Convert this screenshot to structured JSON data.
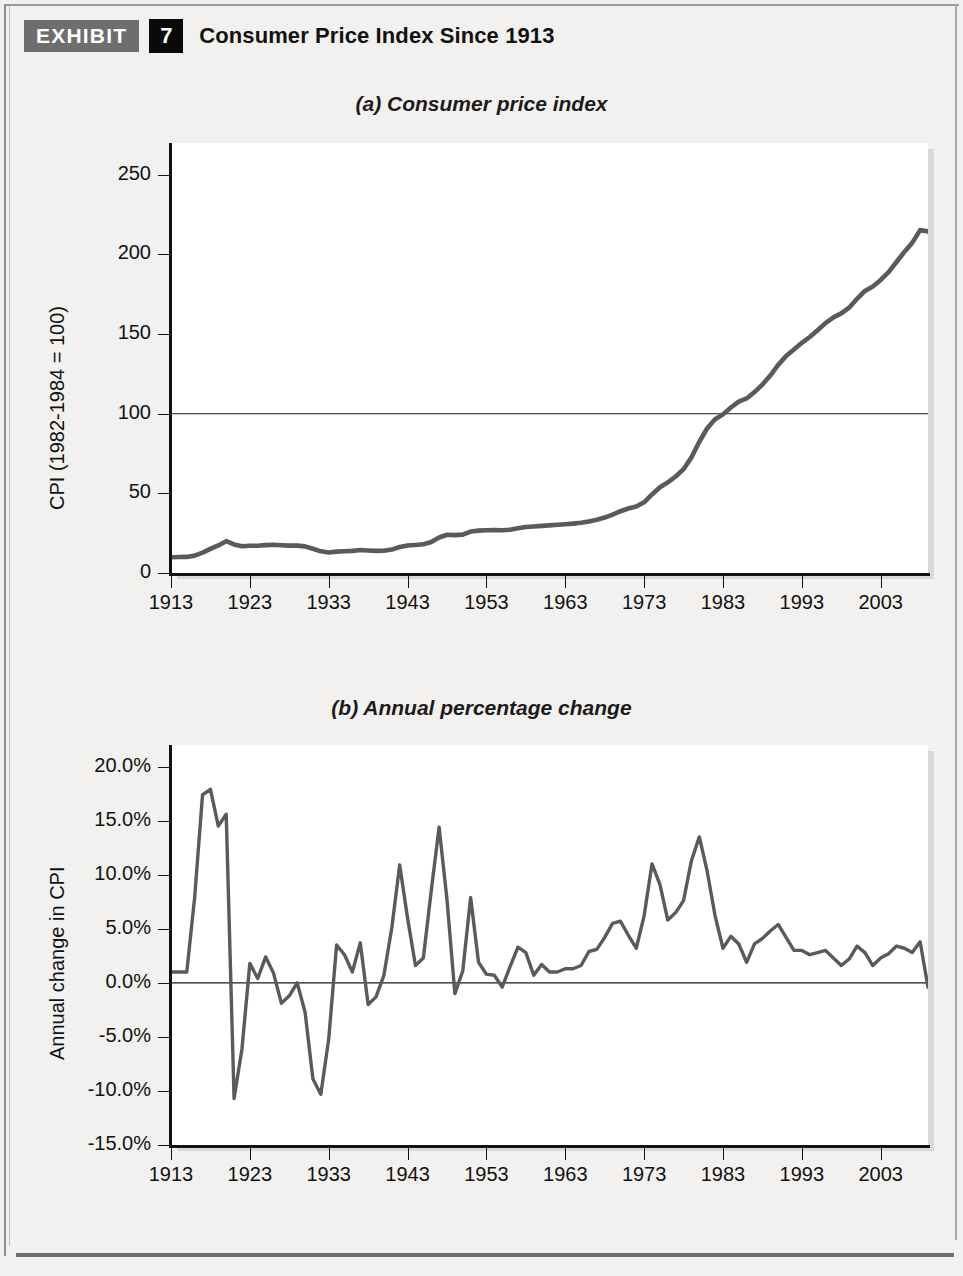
{
  "header": {
    "exhibit_label": "EXHIBIT",
    "exhibit_number": "7",
    "title": "Consumer Price Index Since 1913"
  },
  "chart_data": [
    {
      "type": "line",
      "panel": "a",
      "title": "(a) Consumer price index",
      "xlabel": "",
      "ylabel": "CPI (1982-1984 = 100)",
      "xlim": [
        1913,
        2009
      ],
      "ylim": [
        0,
        270
      ],
      "yticks": [
        0,
        50,
        100,
        150,
        200,
        250
      ],
      "ytick_labels": [
        "0",
        "50",
        "100",
        "150",
        "200",
        "250"
      ],
      "xticks": [
        1913,
        1923,
        1933,
        1943,
        1953,
        1963,
        1973,
        1983,
        1993,
        2003
      ],
      "xtick_labels": [
        "1913",
        "1923",
        "1933",
        "1943",
        "1953",
        "1963",
        "1973",
        "1983",
        "1993",
        "2003"
      ],
      "grid": false,
      "reference_line": 100,
      "legend": null,
      "line_color": "#5a5a5a",
      "x": [
        1913,
        1914,
        1915,
        1916,
        1917,
        1918,
        1919,
        1920,
        1921,
        1922,
        1923,
        1924,
        1925,
        1926,
        1927,
        1928,
        1929,
        1930,
        1931,
        1932,
        1933,
        1934,
        1935,
        1936,
        1937,
        1938,
        1939,
        1940,
        1941,
        1942,
        1943,
        1944,
        1945,
        1946,
        1947,
        1948,
        1949,
        1950,
        1951,
        1952,
        1953,
        1954,
        1955,
        1956,
        1957,
        1958,
        1959,
        1960,
        1961,
        1962,
        1963,
        1964,
        1965,
        1966,
        1967,
        1968,
        1969,
        1970,
        1971,
        1972,
        1973,
        1974,
        1975,
        1976,
        1977,
        1978,
        1979,
        1980,
        1981,
        1982,
        1983,
        1984,
        1985,
        1986,
        1987,
        1988,
        1989,
        1990,
        1991,
        1992,
        1993,
        1994,
        1995,
        1996,
        1997,
        1998,
        1999,
        2000,
        2001,
        2002,
        2003,
        2004,
        2005,
        2006,
        2007,
        2008,
        2009
      ],
      "values": [
        9.9,
        10.0,
        10.1,
        10.9,
        12.8,
        15.1,
        17.3,
        20.0,
        17.9,
        16.8,
        17.1,
        17.1,
        17.5,
        17.7,
        17.4,
        17.2,
        17.2,
        16.7,
        15.2,
        13.6,
        12.9,
        13.4,
        13.7,
        13.9,
        14.4,
        14.1,
        13.9,
        14.0,
        14.7,
        16.3,
        17.3,
        17.6,
        18.0,
        19.5,
        22.3,
        24.0,
        23.8,
        24.1,
        26.0,
        26.6,
        26.8,
        26.9,
        26.8,
        27.2,
        28.1,
        28.9,
        29.2,
        29.6,
        29.9,
        30.3,
        30.6,
        31.0,
        31.5,
        32.4,
        33.4,
        34.8,
        36.7,
        38.8,
        40.5,
        41.8,
        44.4,
        49.3,
        53.8,
        56.9,
        60.6,
        65.2,
        72.6,
        82.4,
        90.9,
        96.5,
        99.6,
        103.9,
        107.6,
        109.6,
        113.6,
        118.3,
        124.0,
        130.7,
        136.2,
        140.3,
        144.5,
        148.2,
        152.4,
        156.9,
        160.5,
        163.0,
        166.6,
        172.2,
        177.1,
        179.9,
        184.0,
        188.9,
        195.3,
        201.6,
        207.3,
        215.3,
        214.5
      ]
    },
    {
      "type": "line",
      "panel": "b",
      "title": "(b) Annual percentage change",
      "xlabel": "",
      "ylabel": "Annual change in CPI",
      "xlim": [
        1913,
        2009
      ],
      "ylim": [
        -15.0,
        22.0
      ],
      "yticks": [
        -15.0,
        -10.0,
        -5.0,
        0.0,
        5.0,
        10.0,
        15.0,
        20.0
      ],
      "ytick_labels": [
        "-15.0%",
        "-10.0%",
        "-5.0%",
        "0.0%",
        "5.0%",
        "10.0%",
        "15.0%",
        "20.0%"
      ],
      "xticks": [
        1913,
        1923,
        1933,
        1943,
        1953,
        1963,
        1973,
        1983,
        1993,
        2003
      ],
      "xtick_labels": [
        "1913",
        "1923",
        "1933",
        "1943",
        "1953",
        "1963",
        "1973",
        "1983",
        "1993",
        "2003"
      ],
      "grid": false,
      "reference_line": 0,
      "legend": null,
      "line_color": "#5a5a5a",
      "x": [
        1913,
        1914,
        1915,
        1916,
        1917,
        1918,
        1919,
        1920,
        1921,
        1922,
        1923,
        1924,
        1925,
        1926,
        1927,
        1928,
        1929,
        1930,
        1931,
        1932,
        1933,
        1934,
        1935,
        1936,
        1937,
        1938,
        1939,
        1940,
        1941,
        1942,
        1943,
        1944,
        1945,
        1946,
        1947,
        1948,
        1949,
        1950,
        1951,
        1952,
        1953,
        1954,
        1955,
        1956,
        1957,
        1958,
        1959,
        1960,
        1961,
        1962,
        1963,
        1964,
        1965,
        1966,
        1967,
        1968,
        1969,
        1970,
        1971,
        1972,
        1973,
        1974,
        1975,
        1976,
        1977,
        1978,
        1979,
        1980,
        1981,
        1982,
        1983,
        1984,
        1985,
        1986,
        1987,
        1988,
        1989,
        1990,
        1991,
        1992,
        1993,
        1994,
        1995,
        1996,
        1997,
        1998,
        1999,
        2000,
        2001,
        2002,
        2003,
        2004,
        2005,
        2006,
        2007,
        2008,
        2009
      ],
      "values": [
        1.0,
        1.0,
        1.0,
        7.9,
        17.4,
        17.9,
        14.5,
        15.6,
        -10.7,
        -6.1,
        1.8,
        0.4,
        2.4,
        0.9,
        -1.9,
        -1.2,
        0.0,
        -2.7,
        -8.9,
        -10.3,
        -5.2,
        3.5,
        2.6,
        1.0,
        3.7,
        -2.0,
        -1.3,
        0.7,
        5.1,
        10.9,
        6.0,
        1.6,
        2.3,
        8.5,
        14.4,
        7.7,
        -1.0,
        1.1,
        7.9,
        1.9,
        0.8,
        0.7,
        -0.4,
        1.5,
        3.3,
        2.8,
        0.7,
        1.7,
        1.0,
        1.0,
        1.3,
        1.3,
        1.6,
        2.9,
        3.1,
        4.2,
        5.5,
        5.7,
        4.4,
        3.2,
        6.2,
        11.0,
        9.1,
        5.8,
        6.5,
        7.6,
        11.3,
        13.5,
        10.3,
        6.2,
        3.2,
        4.3,
        3.6,
        1.9,
        3.6,
        4.1,
        4.8,
        5.4,
        4.2,
        3.0,
        3.0,
        2.6,
        2.8,
        3.0,
        2.3,
        1.6,
        2.2,
        3.4,
        2.8,
        1.6,
        2.3,
        2.7,
        3.4,
        3.2,
        2.8,
        3.8,
        -0.4
      ]
    }
  ],
  "footer": {
    "note": ""
  }
}
